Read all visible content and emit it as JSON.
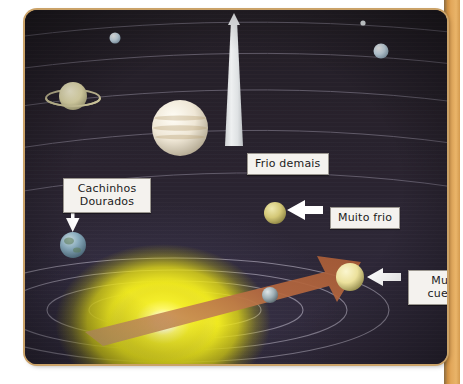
{
  "page": {
    "background_color": "#ffffff",
    "strip_color": "#e2a75a"
  },
  "scene": {
    "name": "solar-system-habitable-zone-illustration",
    "background_color": "#2a2430",
    "frame_border_color": "#caa268",
    "sun": {
      "name": "Sol",
      "core_color": "#ffffff",
      "glow_color": "#f2ec2a"
    },
    "orbit_color": "#b9b3c4",
    "arrow_color": "#b4673f"
  },
  "callouts": [
    {
      "id": "cachinhos",
      "text": "Cachinhos\nDourados",
      "target": "Terra"
    },
    {
      "id": "frio",
      "text": "Frio demais",
      "target": "Jupiter"
    },
    {
      "id": "muito-frio",
      "text": "Muito frio",
      "target": "Marte"
    },
    {
      "id": "muito-quente",
      "text": "Muito\ncuente",
      "target": "Venus"
    }
  ],
  "bodies": [
    {
      "id": "saturno",
      "label": "Saturno",
      "color": "#ded8b0"
    },
    {
      "id": "jupiter",
      "label": "Jupiter",
      "color": "#efe9dc"
    },
    {
      "id": "urano",
      "label": "Urano",
      "color": "#cfe3ee"
    },
    {
      "id": "netuno",
      "label": "Netuno",
      "color": "#dfe9f2"
    },
    {
      "id": "marte",
      "label": "Marte",
      "color": "#d9d07e"
    },
    {
      "id": "terra",
      "label": "Terra",
      "color": "#9fb9c6"
    },
    {
      "id": "venus",
      "label": "Venus",
      "color": "#efe6a8"
    },
    {
      "id": "mercurio",
      "label": "Mercurio",
      "color": "#b9bfc2"
    }
  ]
}
